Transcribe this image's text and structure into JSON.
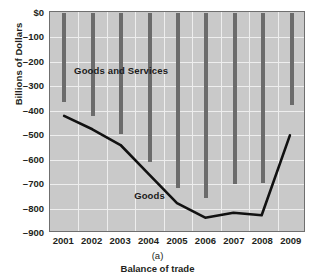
{
  "chart_data": {
    "type": "bar",
    "title": "",
    "subtitle": "",
    "xlabel": "Balance of trade",
    "ylabel": "Billions of Dollars",
    "panel_letter": "(a)",
    "categories": [
      "2001",
      "2002",
      "2003",
      "2004",
      "2005",
      "2006",
      "2007",
      "2008",
      "2009"
    ],
    "ylim": [
      -900,
      0
    ],
    "ytick_values": [
      0,
      -100,
      -200,
      -300,
      -400,
      -500,
      -600,
      -700,
      -800,
      -900
    ],
    "ytick_labels": [
      "$0",
      "–100",
      "–200",
      "–300",
      "–400",
      "–500",
      "–600",
      "–700",
      "–800",
      "–900"
    ],
    "grid": true,
    "legend_position": "inline-annotations",
    "series": [
      {
        "name": "Goods and Services",
        "render": "bar",
        "color": "#6b6b6b",
        "values": [
          -365,
          -420,
          -495,
          -610,
          -715,
          -755,
          -700,
          -695,
          -375
        ]
      },
      {
        "name": "Goods",
        "render": "line",
        "color": "#111111",
        "values": [
          -425,
          -480,
          -545,
          -665,
          -785,
          -845,
          -825,
          -835,
          -505
        ]
      }
    ],
    "annotations": [
      {
        "text": "Goods and Services",
        "x_category": "2003",
        "y_value": -235
      },
      {
        "text": "Goods",
        "x_category": "2004",
        "y_value": -745
      }
    ],
    "colors": {
      "plot_background": "#c9c9c9",
      "grid": "#eeeeee",
      "axis_border": "#6f6f6f",
      "bar": "#6b6b6b",
      "line": "#111111",
      "text": "#231f20",
      "page_background": "#ffffff"
    }
  }
}
